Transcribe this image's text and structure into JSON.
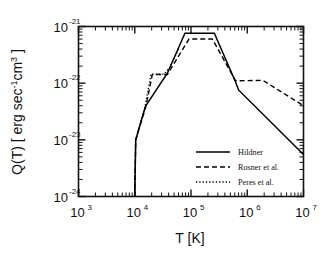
{
  "chart_data": {
    "type": "line",
    "title": "",
    "xlabel": "T [K]",
    "ylabel": "Q(T) [ erg sec-1cm3 ]",
    "ylabel_parts": {
      "prefix": "Q(T) [ erg sec",
      "sup1": "-1",
      "mid": "cm",
      "sup2": "3",
      "suffix": " ]"
    },
    "xscale": "log",
    "yscale": "log",
    "xlim": [
      1000,
      10000000
    ],
    "ylim": [
      1e-24,
      1e-21
    ],
    "grid": false,
    "legend_position": "lower-right-inside",
    "xticks": [
      {
        "value": 1000,
        "mantissa": "10",
        "exponent": "3"
      },
      {
        "value": 10000,
        "mantissa": "10",
        "exponent": "4"
      },
      {
        "value": 100000,
        "mantissa": "10",
        "exponent": "5"
      },
      {
        "value": 1000000,
        "mantissa": "10",
        "exponent": "6"
      },
      {
        "value": 10000000,
        "mantissa": "10",
        "exponent": "7"
      }
    ],
    "yticks": [
      {
        "value": 1e-21,
        "mantissa": "10",
        "exponent": "-21"
      },
      {
        "value": 1e-22,
        "mantissa": "10",
        "exponent": "-22"
      },
      {
        "value": 1e-23,
        "mantissa": "10",
        "exponent": "-23"
      },
      {
        "value": 1e-24,
        "mantissa": "10",
        "exponent": "-24"
      }
    ],
    "series": [
      {
        "name": "Hildner",
        "style": "solid",
        "color": "#000000",
        "points": [
          [
            10000,
            1e-24
          ],
          [
            10400,
            1e-23
          ],
          [
            15500,
            3.9e-23
          ],
          [
            38000,
            1.5e-22
          ],
          [
            78000,
            7.6e-22
          ],
          [
            260000,
            7.6e-22
          ],
          [
            620000,
            1.05e-22
          ],
          [
            700000,
            7.6e-23
          ],
          [
            10000000,
            5.5e-24
          ]
        ]
      },
      {
        "name": "Rosner et al.",
        "style": "dashed",
        "color": "#000000",
        "points": [
          [
            10000,
            1e-24
          ],
          [
            10400,
            1e-23
          ],
          [
            15800,
            3.9e-23
          ],
          [
            20500,
            1.42e-22
          ],
          [
            38000,
            1.42e-22
          ],
          [
            92000,
            6e-22
          ],
          [
            240000,
            6e-22
          ],
          [
            620000,
            1.1e-22
          ],
          [
            1900000,
            1.12e-22
          ],
          [
            10000000,
            4e-23
          ]
        ]
      },
      {
        "name": "Peres et al.",
        "style": "dotted",
        "color": "#000000",
        "points": [
          [
            10000,
            1e-24
          ],
          [
            10400,
            1e-23
          ],
          [
            15000,
            3.6e-23
          ],
          [
            19500,
            1.44e-22
          ],
          [
            33000,
            1.44e-22
          ],
          [
            42000,
            1.9e-22
          ],
          [
            62000,
            4.2e-22
          ]
        ]
      }
    ]
  },
  "legend": {
    "items": [
      {
        "label": "Hildner",
        "style": "solid"
      },
      {
        "label": "Rosner et al.",
        "style": "dashed"
      },
      {
        "label": "Peres et al.",
        "style": "dotted"
      }
    ]
  }
}
